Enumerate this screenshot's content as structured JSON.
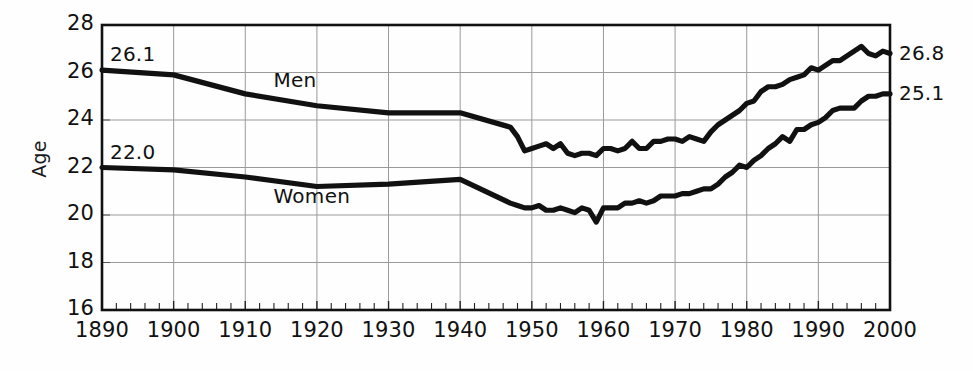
{
  "chart_data": {
    "type": "line",
    "title": "",
    "xlabel": "",
    "ylabel": "Age",
    "xlim": [
      1890,
      2000
    ],
    "ylim": [
      16,
      28
    ],
    "grid": true,
    "legend_position": "inline-annotation",
    "xticks": [
      "1890",
      "1900",
      "1910",
      "1920",
      "1930",
      "1940",
      "1950",
      "1960",
      "1970",
      "1980",
      "1990",
      "2000"
    ],
    "yticks": [
      "16",
      "18",
      "20",
      "22",
      "24",
      "26",
      "28"
    ],
    "minor_tick_interval_years": 2,
    "annotations": [
      {
        "name": "men-start-value",
        "text": "26.1",
        "x": 1890,
        "y": 26.1
      },
      {
        "name": "women-start-value",
        "text": "22.0",
        "x": 1890,
        "y": 22.0
      },
      {
        "name": "men-end-value",
        "text": "26.8",
        "x": 2000,
        "y": 26.8
      },
      {
        "name": "women-end-value",
        "text": "25.1",
        "x": 2000,
        "y": 25.1
      },
      {
        "name": "men-series-label",
        "text": "Men",
        "x": 1917,
        "y": 25.6
      },
      {
        "name": "women-series-label",
        "text": "Women",
        "x": 1917,
        "y": 20.7
      }
    ],
    "series": [
      {
        "name": "Men",
        "color": "#111111",
        "x": [
          1890,
          1900,
          1910,
          1920,
          1930,
          1940,
          1947,
          1948,
          1949,
          1950,
          1951,
          1952,
          1953,
          1954,
          1955,
          1956,
          1957,
          1958,
          1959,
          1960,
          1961,
          1962,
          1963,
          1964,
          1965,
          1966,
          1967,
          1968,
          1969,
          1970,
          1971,
          1972,
          1973,
          1974,
          1975,
          1976,
          1977,
          1978,
          1979,
          1980,
          1981,
          1982,
          1983,
          1984,
          1985,
          1986,
          1987,
          1988,
          1989,
          1990,
          1991,
          1992,
          1993,
          1994,
          1995,
          1996,
          1997,
          1998,
          1999,
          2000
        ],
        "values": [
          26.1,
          25.9,
          25.1,
          24.6,
          24.3,
          24.3,
          23.7,
          23.3,
          22.7,
          22.8,
          22.9,
          23.0,
          22.8,
          23.0,
          22.6,
          22.5,
          22.6,
          22.6,
          22.5,
          22.8,
          22.8,
          22.7,
          22.8,
          23.1,
          22.8,
          22.8,
          23.1,
          23.1,
          23.2,
          23.2,
          23.1,
          23.3,
          23.2,
          23.1,
          23.5,
          23.8,
          24.0,
          24.2,
          24.4,
          24.7,
          24.8,
          25.2,
          25.4,
          25.4,
          25.5,
          25.7,
          25.8,
          25.9,
          26.2,
          26.1,
          26.3,
          26.5,
          26.5,
          26.7,
          26.9,
          27.1,
          26.8,
          26.7,
          26.9,
          26.8
        ]
      },
      {
        "name": "Women",
        "color": "#111111",
        "x": [
          1890,
          1900,
          1910,
          1920,
          1930,
          1940,
          1947,
          1948,
          1949,
          1950,
          1951,
          1952,
          1953,
          1954,
          1955,
          1956,
          1957,
          1958,
          1959,
          1960,
          1961,
          1962,
          1963,
          1964,
          1965,
          1966,
          1967,
          1968,
          1969,
          1970,
          1971,
          1972,
          1973,
          1974,
          1975,
          1976,
          1977,
          1978,
          1979,
          1980,
          1981,
          1982,
          1983,
          1984,
          1985,
          1986,
          1987,
          1988,
          1989,
          1990,
          1991,
          1992,
          1993,
          1994,
          1995,
          1996,
          1997,
          1998,
          1999,
          2000
        ],
        "values": [
          22.0,
          21.9,
          21.6,
          21.2,
          21.3,
          21.5,
          20.5,
          20.4,
          20.3,
          20.3,
          20.4,
          20.2,
          20.2,
          20.3,
          20.2,
          20.1,
          20.3,
          20.2,
          19.7,
          20.3,
          20.3,
          20.3,
          20.5,
          20.5,
          20.6,
          20.5,
          20.6,
          20.8,
          20.8,
          20.8,
          20.9,
          20.9,
          21.0,
          21.1,
          21.1,
          21.3,
          21.6,
          21.8,
          22.1,
          22.0,
          22.3,
          22.5,
          22.8,
          23.0,
          23.3,
          23.1,
          23.6,
          23.6,
          23.8,
          23.9,
          24.1,
          24.4,
          24.5,
          24.5,
          24.5,
          24.8,
          25.0,
          25.0,
          25.1,
          25.1
        ]
      }
    ]
  },
  "plot_geometry": {
    "left": 102,
    "top": 25,
    "right": 890,
    "bottom": 310
  }
}
